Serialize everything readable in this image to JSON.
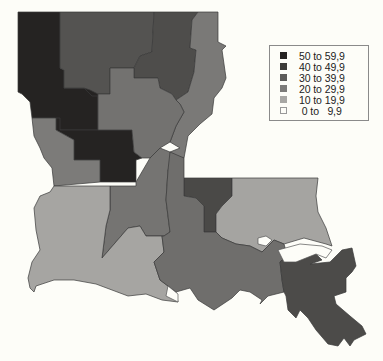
{
  "legend": {
    "items": [
      {
        "label": "50 to 59,9",
        "color": "#252322"
      },
      {
        "label": "40 to 49,9",
        "color": "#3c3b39"
      },
      {
        "label": "30 to 39,9",
        "color": "#5c5b59"
      },
      {
        "label": "20 to 29,9",
        "color": "#7c7b79"
      },
      {
        "label": "10 to 19,9",
        "color": "#a8a7a4"
      },
      {
        "label": " 0 to   9,9",
        "color": "#fdfdf8"
      }
    ]
  },
  "map": {
    "region": "Louisiana",
    "regions": [
      {
        "name": "northwest-west",
        "class": "50 to 59,9"
      },
      {
        "name": "northwest-center",
        "class": "50 to 59,9"
      },
      {
        "name": "north-central",
        "class": "30 to 39,9"
      },
      {
        "name": "northeast",
        "class": "30 to 39,9"
      },
      {
        "name": "east-delta",
        "class": "20 to 29,9"
      },
      {
        "name": "central",
        "class": "20 to 29,9"
      },
      {
        "name": "west-central",
        "class": "20 to 29,9"
      },
      {
        "name": "south-central",
        "class": "20 to 29,9"
      },
      {
        "name": "southwest",
        "class": "10 to 19,9"
      },
      {
        "name": "capital-area",
        "class": "30 to 39,9"
      },
      {
        "name": "florida-parishes",
        "class": "10 to 19,9"
      },
      {
        "name": "acadiana-south",
        "class": "20 to 29,9"
      },
      {
        "name": "southeast",
        "class": "30 to 39,9"
      },
      {
        "name": "upper-river",
        "class": "20 to 29,9"
      }
    ]
  }
}
